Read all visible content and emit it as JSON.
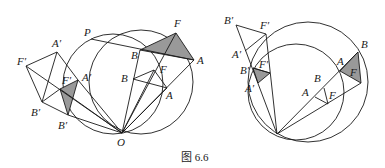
{
  "caption": "图 6.6",
  "figures": {
    "left": {
      "labels": {
        "P": "P",
        "F": "F",
        "B": "B",
        "A": "A",
        "B1": "B",
        "F1": "F",
        "A1": "A",
        "sub1": "1",
        "F1p": "F′",
        "A1p": "A′",
        "B1p": "B′",
        "Fp": "F′",
        "Ap": "A′",
        "Bp": "B′",
        "O": "O"
      }
    },
    "right": {
      "labels": {
        "B1p": "B′",
        "F1p": "F′",
        "A1p": "A′",
        "sub1": "1",
        "Bp": "B′",
        "Fp": "F′",
        "Ap": "A′",
        "A": "A",
        "B": "B",
        "F": "F",
        "B1": "B",
        "A1": "A",
        "F1": "F"
      }
    }
  },
  "colors": {
    "stroke": "#1a1a1a",
    "hatch": "#555555"
  }
}
